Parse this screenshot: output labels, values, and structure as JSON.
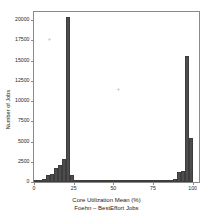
{
  "chart_data": {
    "type": "bar",
    "title": "",
    "xlabel": "Core Utilization Mean (%)",
    "sublabel": "Foehn – BestEffort Jobs",
    "ylabel": "Number of Jobs",
    "grid": false,
    "legend": null,
    "xlim": [
      0,
      104
    ],
    "ylim": [
      0,
      21000
    ],
    "xticks": [
      0,
      25,
      50,
      75,
      100
    ],
    "xtick_labels": [
      "0",
      "25",
      "50",
      "75",
      "100"
    ],
    "yticks": [
      0,
      2500,
      5000,
      7500,
      10000,
      12500,
      15000,
      17500,
      20000
    ],
    "ytick_labels": [
      "0",
      "2500",
      "5000",
      "7500",
      "10000",
      "12500",
      "15000",
      "17500",
      "20000"
    ],
    "bar_color": "#4d4d4d",
    "bin_width": 2.5,
    "bins": [
      {
        "x0": 0.0,
        "x1": 2.5,
        "value": 60
      },
      {
        "x0": 2.5,
        "x1": 5.0,
        "value": 260
      },
      {
        "x0": 5.0,
        "x1": 7.5,
        "value": 430
      },
      {
        "x0": 7.5,
        "x1": 10.0,
        "value": 900
      },
      {
        "x0": 10.0,
        "x1": 12.5,
        "value": 1000
      },
      {
        "x0": 12.5,
        "x1": 15.0,
        "value": 1750
      },
      {
        "x0": 15.0,
        "x1": 17.5,
        "value": 2100
      },
      {
        "x0": 17.5,
        "x1": 20.0,
        "value": 2800
      },
      {
        "x0": 20.0,
        "x1": 22.5,
        "value": 20400
      },
      {
        "x0": 22.5,
        "x1": 25.0,
        "value": 900
      },
      {
        "x0": 25.0,
        "x1": 27.5,
        "value": 180
      },
      {
        "x0": 27.5,
        "x1": 30.0,
        "value": 120
      },
      {
        "x0": 30.0,
        "x1": 32.5,
        "value": 100
      },
      {
        "x0": 32.5,
        "x1": 35.0,
        "value": 90
      },
      {
        "x0": 35.0,
        "x1": 37.5,
        "value": 85
      },
      {
        "x0": 37.5,
        "x1": 40.0,
        "value": 80
      },
      {
        "x0": 40.0,
        "x1": 42.5,
        "value": 78
      },
      {
        "x0": 42.5,
        "x1": 45.0,
        "value": 75
      },
      {
        "x0": 45.0,
        "x1": 47.5,
        "value": 72
      },
      {
        "x0": 47.5,
        "x1": 50.0,
        "value": 70
      },
      {
        "x0": 50.0,
        "x1": 52.5,
        "value": 70
      },
      {
        "x0": 52.5,
        "x1": 55.0,
        "value": 68
      },
      {
        "x0": 55.0,
        "x1": 57.5,
        "value": 68
      },
      {
        "x0": 57.5,
        "x1": 60.0,
        "value": 66
      },
      {
        "x0": 60.0,
        "x1": 62.5,
        "value": 66
      },
      {
        "x0": 62.5,
        "x1": 65.0,
        "value": 65
      },
      {
        "x0": 65.0,
        "x1": 67.5,
        "value": 65
      },
      {
        "x0": 67.5,
        "x1": 70.0,
        "value": 64
      },
      {
        "x0": 70.0,
        "x1": 72.5,
        "value": 64
      },
      {
        "x0": 72.5,
        "x1": 75.0,
        "value": 66
      },
      {
        "x0": 75.0,
        "x1": 77.5,
        "value": 70
      },
      {
        "x0": 77.5,
        "x1": 80.0,
        "value": 80
      },
      {
        "x0": 80.0,
        "x1": 82.5,
        "value": 95
      },
      {
        "x0": 82.5,
        "x1": 85.0,
        "value": 120
      },
      {
        "x0": 85.0,
        "x1": 87.5,
        "value": 200
      },
      {
        "x0": 87.5,
        "x1": 90.0,
        "value": 420
      },
      {
        "x0": 90.0,
        "x1": 92.5,
        "value": 1250
      },
      {
        "x0": 92.5,
        "x1": 95.0,
        "value": 1300
      },
      {
        "x0": 95.0,
        "x1": 97.5,
        "value": 15600
      },
      {
        "x0": 97.5,
        "x1": 100.0,
        "value": 5400
      }
    ]
  }
}
